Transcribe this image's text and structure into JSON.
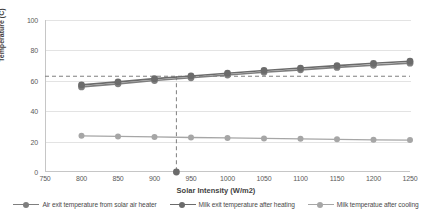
{
  "chart_data": {
    "type": "line",
    "title": "",
    "xlabel": "Solar Intensity (W/m2)",
    "ylabel": "Temperature (C)",
    "xlim": [
      750,
      1250
    ],
    "ylim": [
      0,
      100
    ],
    "xticks": [
      750,
      800,
      850,
      900,
      950,
      1000,
      1050,
      1100,
      1150,
      1200,
      1250
    ],
    "yticks": [
      0,
      20,
      40,
      60,
      80,
      100
    ],
    "grid": true,
    "legend_position": "bottom",
    "x": [
      800,
      850,
      900,
      950,
      1000,
      1050,
      1100,
      1150,
      1200,
      1250
    ],
    "series": [
      {
        "name": "Air exit temperature from solar air heater",
        "color": "#7f7f7f",
        "values": [
          56.0,
          58.0,
          60.2,
          62.0,
          63.8,
          65.6,
          67.2,
          68.8,
          70.2,
          71.6
        ]
      },
      {
        "name": "Milk exit temperature after heating",
        "color": "#6b6b6b",
        "values": [
          57.3,
          59.3,
          61.4,
          63.2,
          65.0,
          66.8,
          68.4,
          70.0,
          71.5,
          72.9
        ]
      },
      {
        "name": "Milk temperatue after cooling",
        "color": "#a6a6a6",
        "values": [
          23.8,
          23.4,
          23.1,
          22.7,
          22.4,
          22.1,
          21.8,
          21.5,
          21.2,
          21.0
        ]
      }
    ],
    "annotations": [
      {
        "name": "pasteurization-temperature-guide",
        "type": "horizontal-dashed-line",
        "y": 63,
        "color": "#7f7f7f"
      },
      {
        "name": "critical-solar-intensity-guide",
        "type": "vertical-dashed-line",
        "x": 930,
        "color": "#7f7f7f"
      },
      {
        "name": "critical-solar-intensity-marker",
        "type": "point",
        "x": 930,
        "y": 0,
        "color": "#6b6b6b"
      }
    ]
  }
}
